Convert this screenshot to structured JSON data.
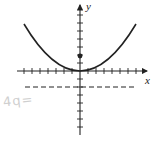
{
  "diagram": {
    "type": "parabola-graph",
    "equation": "x^2 = 8y",
    "axes": {
      "x_label": "x",
      "y_label": "y",
      "x_range": [
        -7,
        7
      ],
      "y_range": [
        -7,
        7
      ],
      "tick_spacing": 1
    },
    "vertex": [
      0,
      0
    ],
    "focus": [
      0,
      2
    ],
    "directrix": "y = -2",
    "colors": {
      "ink": "#222222",
      "scribble": "#cfcfcf"
    },
    "handwritten_note": "4q="
  }
}
